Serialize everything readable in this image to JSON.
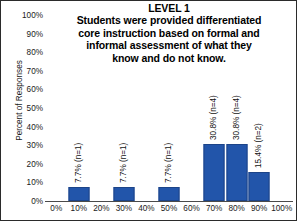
{
  "chart_data": {
    "type": "bar",
    "title": "LEVEL 1",
    "subtitle_lines": [
      "Students were provided differentiated",
      "core instruction based on formal and",
      "informal assessment of what they",
      "know and do not know."
    ],
    "xlabel": "",
    "ylabel": "Percent of Responses",
    "categories": [
      "0%",
      "10%",
      "20%",
      "30%",
      "40%",
      "50%",
      "60%",
      "70%",
      "80%",
      "90%",
      "100%"
    ],
    "values": [
      0,
      7.7,
      0,
      7.7,
      0,
      7.7,
      0,
      30.8,
      30.8,
      15.4,
      0
    ],
    "counts": [
      0,
      1,
      0,
      1,
      0,
      1,
      0,
      4,
      4,
      2,
      0
    ],
    "bars": [
      {
        "category": "10%",
        "value": 7.7,
        "n": 1,
        "label": "7.7% (n=1)"
      },
      {
        "category": "30%",
        "value": 7.7,
        "n": 1,
        "label": "7.7% (n=1)"
      },
      {
        "category": "50%",
        "value": 7.7,
        "n": 1,
        "label": "7.7% (n=1)"
      },
      {
        "category": "70%",
        "value": 30.8,
        "n": 4,
        "label": "30.8% (n=4)"
      },
      {
        "category": "80%",
        "value": 30.8,
        "n": 4,
        "label": "30.8% (n=4)"
      },
      {
        "category": "90%",
        "value": 15.4,
        "n": 2,
        "label": "15.4% (n=2)"
      }
    ],
    "ylim": [
      0,
      100
    ],
    "yticks": [
      "0%",
      "10%",
      "20%",
      "30%",
      "40%",
      "50%",
      "60%",
      "70%",
      "80%",
      "90%",
      "100%"
    ],
    "xticks": [
      "0%",
      "10%",
      "20%",
      "30%",
      "40%",
      "50%",
      "60%",
      "70%",
      "80%",
      "90%",
      "100%"
    ],
    "grid": false,
    "legend": "none",
    "bar_color": "#2255aa",
    "bar_edge_color": "#1c4488",
    "text_color": "#111111",
    "background": "#ffffff",
    "border_color": "#2b2b2b"
  }
}
